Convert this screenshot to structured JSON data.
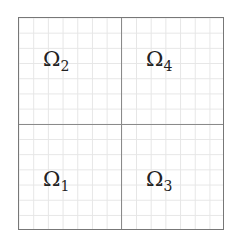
{
  "diagram": {
    "type": "domain-decomposition",
    "grid": {
      "rows": 2,
      "cols": 2,
      "fine_cells_per_quadrant": 7
    },
    "colors": {
      "border": "#777777",
      "midlines": "#8a8a8a",
      "fine_grid": "#e6e6e6",
      "label": "#222222",
      "background": "#ffffff"
    },
    "subdomains": [
      {
        "position": "top-left",
        "symbol": "Ω",
        "index": "2"
      },
      {
        "position": "top-right",
        "symbol": "Ω",
        "index": "4"
      },
      {
        "position": "bottom-left",
        "symbol": "Ω",
        "index": "1"
      },
      {
        "position": "bottom-right",
        "symbol": "Ω",
        "index": "3"
      }
    ]
  }
}
